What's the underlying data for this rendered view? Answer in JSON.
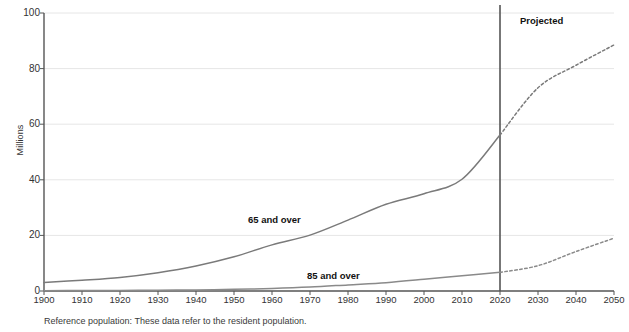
{
  "chart_data": {
    "type": "line",
    "title": "",
    "subtitle": "",
    "xlabel": "",
    "ylabel": "Millions",
    "xlim": [
      1900,
      2050
    ],
    "ylim": [
      0,
      100
    ],
    "grid": true,
    "legend_position": "inline-annotations",
    "x_ticks": [
      1900,
      1910,
      1920,
      1930,
      1940,
      1950,
      1960,
      1970,
      1980,
      1990,
      2000,
      2010,
      2020,
      2030,
      2040,
      2050
    ],
    "y_ticks": [
      0,
      20,
      40,
      60,
      80,
      100
    ],
    "x": [
      1900,
      1910,
      1920,
      1930,
      1940,
      1950,
      1960,
      1970,
      1980,
      1990,
      2000,
      2010,
      2020,
      2030,
      2040,
      2050
    ],
    "series": [
      {
        "name": "65 and over",
        "label": "65 and over",
        "color": "#7a7a7a",
        "values": [
          3.1,
          3.9,
          4.9,
          6.6,
          9.0,
          12.3,
          16.6,
          20.1,
          25.5,
          31.2,
          35.0,
          40.2,
          56.1,
          73.1,
          81.2,
          88.5
        ],
        "projected_from": 2020,
        "projected_style": "dotted"
      },
      {
        "name": "85 and over",
        "label": "85 and over",
        "color": "#8a8a8a",
        "values": [
          0.1,
          0.2,
          0.2,
          0.3,
          0.4,
          0.6,
          0.9,
          1.4,
          2.2,
          3.0,
          4.2,
          5.5,
          6.7,
          9.1,
          14.2,
          19.0
        ],
        "projected_from": 2020,
        "projected_style": "dotted"
      }
    ],
    "annotations": [
      {
        "name": "projected-label",
        "text": "Projected",
        "x": 2027,
        "y": 96
      },
      {
        "name": "divider-line",
        "text": "",
        "x": 2020
      }
    ],
    "footnote": "Reference population: These data refer to the resident population."
  },
  "labels": {
    "ylabel": "Millions",
    "series_65": "65 and over",
    "series_85": "85 and over",
    "projected": "Projected",
    "footnote": "Reference population: These data refer to the resident population."
  },
  "colors": {
    "line": "#7a7a7a",
    "grid": "#e6e6e6",
    "axis": "#555555",
    "divider": "#555555",
    "text": "#333333"
  }
}
